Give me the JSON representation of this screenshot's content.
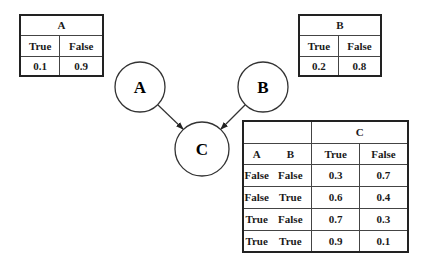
{
  "nodes": [
    {
      "id": "A",
      "label": "A",
      "cx": 140,
      "cy": 87,
      "r": 25
    },
    {
      "id": "B",
      "label": "B",
      "cx": 263,
      "cy": 87,
      "r": 25
    },
    {
      "id": "C",
      "label": "C",
      "cx": 202,
      "cy": 149,
      "r": 27
    }
  ],
  "edges": [
    {
      "from": "A",
      "to": "C"
    },
    {
      "from": "B",
      "to": "C"
    }
  ],
  "cpt_a": {
    "title": "A",
    "headers": [
      "True",
      "False"
    ],
    "values": [
      "0.1",
      "0.9"
    ]
  },
  "cpt_b": {
    "title": "B",
    "headers": [
      "True",
      "False"
    ],
    "values": [
      "0.2",
      "0.8"
    ]
  },
  "cpt_c": {
    "title": "C",
    "parent_headers": [
      "A",
      "B"
    ],
    "headers": [
      "True",
      "False"
    ],
    "rows": [
      {
        "a": "False",
        "b": "False",
        "true": "0.3",
        "false": "0.7"
      },
      {
        "a": "False",
        "b": "True",
        "true": "0.6",
        "false": "0.4"
      },
      {
        "a": "True",
        "b": "False",
        "true": "0.7",
        "false": "0.3"
      },
      {
        "a": "True",
        "b": "True",
        "true": "0.9",
        "false": "0.1"
      }
    ]
  }
}
